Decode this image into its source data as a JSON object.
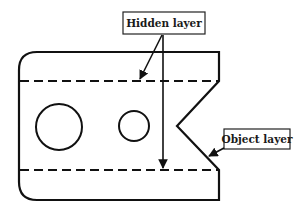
{
  "diagram": {
    "type": "technical-drawing",
    "labels": {
      "hidden": "Hidden layer",
      "object": "Object layer"
    },
    "colors": {
      "stroke": "#111111",
      "background": "#ffffff",
      "label_border": "#222222"
    },
    "part": {
      "outline": "rounded-left rectangle with V-notch on right side",
      "holes": [
        {
          "name": "large-hole",
          "cx": 59,
          "cy": 127,
          "r": 23
        },
        {
          "name": "small-hole",
          "cx": 134,
          "cy": 126,
          "r": 15
        }
      ],
      "hidden_lines": [
        {
          "name": "top-hidden-line",
          "y": 81
        },
        {
          "name": "bottom-hidden-line",
          "y": 170
        }
      ]
    },
    "callouts": [
      {
        "label_key": "hidden",
        "targets": [
          "top-hidden-line",
          "bottom-hidden-line"
        ]
      },
      {
        "label_key": "object",
        "targets": [
          "v-notch-edge"
        ]
      }
    ]
  }
}
